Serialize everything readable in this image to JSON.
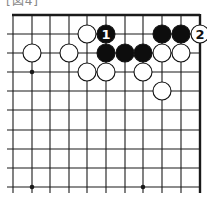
{
  "caption": "[図4]",
  "board": {
    "columns_x": [
      13,
      32,
      50,
      69,
      87,
      106,
      125,
      143,
      162,
      181,
      200
    ],
    "rows_y": [
      15,
      34,
      53,
      72,
      91,
      110,
      130,
      149,
      168,
      187
    ],
    "edges": {
      "top": true,
      "right": true,
      "left": false,
      "bottom": false
    },
    "star_points": [
      [
        1,
        3
      ],
      [
        1,
        9
      ],
      [
        7,
        9
      ]
    ],
    "stone_radius": 9,
    "line_color": "#1a1a1a"
  },
  "stones": [
    {
      "color": "white",
      "col": 4,
      "row": 1,
      "label": ""
    },
    {
      "color": "black",
      "col": 5,
      "row": 1,
      "label": "1"
    },
    {
      "color": "black",
      "col": 8,
      "row": 1,
      "label": ""
    },
    {
      "color": "black",
      "col": 9,
      "row": 1,
      "label": ""
    },
    {
      "color": "white",
      "col": 10,
      "row": 1,
      "label": "2"
    },
    {
      "color": "white",
      "col": 1,
      "row": 2,
      "label": ""
    },
    {
      "color": "white",
      "col": 3,
      "row": 2,
      "label": ""
    },
    {
      "color": "black",
      "col": 5,
      "row": 2,
      "label": ""
    },
    {
      "color": "black",
      "col": 6,
      "row": 2,
      "label": ""
    },
    {
      "color": "black",
      "col": 7,
      "row": 2,
      "label": ""
    },
    {
      "color": "white",
      "col": 8,
      "row": 2,
      "label": ""
    },
    {
      "color": "white",
      "col": 9,
      "row": 2,
      "label": ""
    },
    {
      "color": "white",
      "col": 4,
      "row": 3,
      "label": ""
    },
    {
      "color": "white",
      "col": 5,
      "row": 3,
      "label": ""
    },
    {
      "color": "white",
      "col": 7,
      "row": 3,
      "label": ""
    },
    {
      "color": "white",
      "col": 8,
      "row": 4,
      "label": ""
    }
  ]
}
